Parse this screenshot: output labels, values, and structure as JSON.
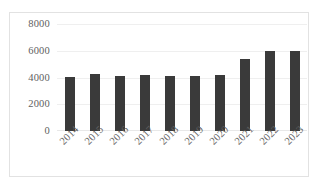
{
  "chart_data": {
    "type": "bar",
    "title": "",
    "subtitle": "",
    "xlabel": "",
    "ylabel": "",
    "categories": [
      "2014",
      "2015",
      "2016",
      "2017",
      "2018",
      "2019",
      "2020",
      "2021",
      "2022",
      "2023"
    ],
    "values": [
      4050,
      4250,
      4150,
      4180,
      4100,
      4100,
      4180,
      5400,
      5950,
      5950
    ],
    "series": [
      {
        "name": "",
        "values": [
          4050,
          4250,
          4150,
          4180,
          4100,
          4100,
          4180,
          5400,
          5950,
          5950
        ]
      }
    ],
    "ylim": [
      0,
      8000
    ],
    "yticks": [
      "0",
      "2000",
      "4000",
      "6000",
      "8000"
    ],
    "ytick_values": [
      0,
      2000,
      4000,
      6000,
      8000
    ],
    "grid": true,
    "grid_axis": "y",
    "legend": false,
    "legend_position": "none",
    "bar_color": "#3a3a3a",
    "plot_background": "#ffffff",
    "border_color": "#e2e2e2",
    "gridline_color": "#efefef",
    "tick_label_color": "#606060",
    "xtick_rotation": -45
  }
}
